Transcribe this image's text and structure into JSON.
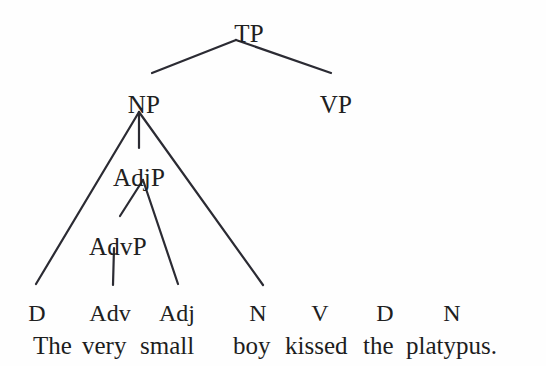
{
  "figure": {
    "type": "syntax-tree",
    "stroke_color": "#2b2b33",
    "text_color": "#202020",
    "background_color": "#fefefe"
  },
  "nodes": {
    "tp": {
      "label": "TP",
      "x": 249,
      "y": 21
    },
    "np": {
      "label": "NP",
      "x": 144,
      "y": 92
    },
    "vp": {
      "label": "VP",
      "x": 336,
      "y": 92
    },
    "adjp": {
      "label": "AdjP",
      "x": 139,
      "y": 165
    },
    "advp": {
      "label": "AdvP",
      "x": 118,
      "y": 234
    }
  },
  "pos_row": [
    {
      "label": "D",
      "x": 37
    },
    {
      "label": "Adv",
      "x": 110
    },
    {
      "label": "Adj",
      "x": 177
    },
    {
      "label": "N",
      "x": 258
    },
    {
      "label": "V",
      "x": 320
    },
    {
      "label": "D",
      "x": 385
    },
    {
      "label": "N",
      "x": 452
    }
  ],
  "pos_row_y": 301,
  "sentence": {
    "y": 333,
    "full_text": "The very small boy kissed the platypus.",
    "words": [
      {
        "text": "The",
        "x": 33,
        "align": "left"
      },
      {
        "text": "very",
        "x": 82,
        "align": "left"
      },
      {
        "text": "small",
        "x": 140,
        "align": "left"
      },
      {
        "text": "boy",
        "x": 233,
        "align": "left"
      },
      {
        "text": "kissed",
        "x": 285,
        "align": "left"
      },
      {
        "text": "the",
        "x": 363,
        "align": "left"
      },
      {
        "text": "platypus.",
        "x": 406,
        "align": "left"
      }
    ]
  },
  "edges": [
    {
      "name": "tp-to-np",
      "x1": 236,
      "y1": 40,
      "x2": 152,
      "y2": 73
    },
    {
      "name": "tp-to-vp",
      "x1": 236,
      "y1": 40,
      "x2": 331,
      "y2": 73
    },
    {
      "name": "np-to-d",
      "x1": 139,
      "y1": 112,
      "x2": 36,
      "y2": 284
    },
    {
      "name": "np-to-adjp",
      "x1": 139,
      "y1": 112,
      "x2": 139,
      "y2": 148
    },
    {
      "name": "np-to-n",
      "x1": 139,
      "y1": 112,
      "x2": 263,
      "y2": 285
    },
    {
      "name": "adjp-to-advp",
      "x1": 143,
      "y1": 180,
      "x2": 120,
      "y2": 216
    },
    {
      "name": "adjp-to-adj",
      "x1": 143,
      "y1": 180,
      "x2": 178,
      "y2": 284
    },
    {
      "name": "advp-to-adv",
      "x1": 114,
      "y1": 248,
      "x2": 113,
      "y2": 285
    }
  ]
}
